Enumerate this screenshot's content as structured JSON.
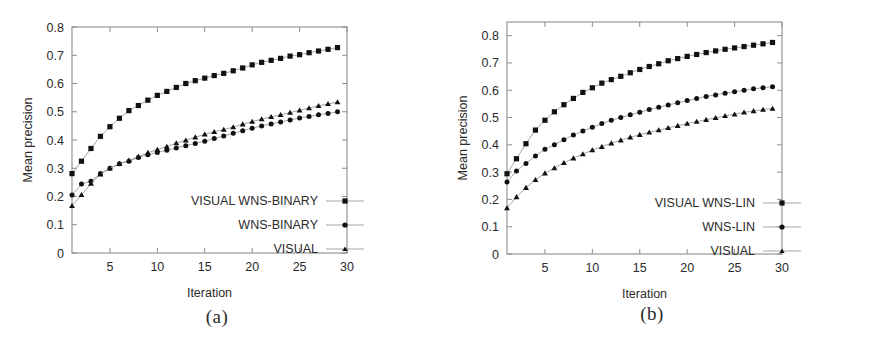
{
  "figure": {
    "panels": [
      {
        "id": "a",
        "subcaption": "(a)",
        "xlabel": "Iteration",
        "ylabel": "Mean precision"
      },
      {
        "id": "b",
        "subcaption": "(b)",
        "xlabel": "Iteration",
        "ylabel": "Mean precision"
      }
    ]
  },
  "chart_data": [
    {
      "panel": "a",
      "type": "line",
      "title": "(a)",
      "xlabel": "Iteration",
      "ylabel": "Mean precision",
      "xlim": [
        1,
        30
      ],
      "ylim": [
        0,
        0.8
      ],
      "xticks": [
        5,
        10,
        15,
        20,
        25,
        30
      ],
      "yticks": [
        "0",
        "0.1",
        "0.2",
        "0.3",
        "0.4",
        "0.5",
        "0.6",
        "0.7",
        "0.8"
      ],
      "ytick_values": [
        0,
        0.1,
        0.2,
        0.3,
        0.4,
        0.5,
        0.6,
        0.7,
        0.8
      ],
      "grid": false,
      "legend_position": "lower right",
      "x": [
        1,
        2,
        3,
        4,
        5,
        6,
        7,
        8,
        9,
        10,
        11,
        12,
        13,
        14,
        15,
        16,
        17,
        18,
        19,
        20,
        21,
        22,
        23,
        24,
        25,
        26,
        27,
        28,
        29
      ],
      "series": [
        {
          "name": "VISUAL WNS-BINARY",
          "marker": "square",
          "color": "#111111",
          "values": [
            0.281,
            0.325,
            0.37,
            0.413,
            0.447,
            0.477,
            0.504,
            0.522,
            0.541,
            0.558,
            0.572,
            0.586,
            0.6,
            0.61,
            0.619,
            0.628,
            0.636,
            0.645,
            0.655,
            0.666,
            0.675,
            0.682,
            0.689,
            0.697,
            0.702,
            0.709,
            0.715,
            0.721,
            0.727
          ]
        },
        {
          "name": "WNS-BINARY",
          "marker": "circle",
          "color": "#111111",
          "values": [
            0.205,
            0.244,
            0.254,
            0.281,
            0.3,
            0.316,
            0.325,
            0.338,
            0.348,
            0.356,
            0.364,
            0.372,
            0.38,
            0.388,
            0.396,
            0.405,
            0.414,
            0.424,
            0.433,
            0.442,
            0.45,
            0.457,
            0.464,
            0.471,
            0.478,
            0.483,
            0.489,
            0.494,
            0.5
          ]
        },
        {
          "name": "VISUAL",
          "marker": "triangle",
          "color": "#111111",
          "values": [
            0.167,
            0.206,
            0.246,
            0.279,
            0.3,
            0.316,
            0.328,
            0.341,
            0.355,
            0.366,
            0.377,
            0.389,
            0.399,
            0.41,
            0.42,
            0.429,
            0.437,
            0.446,
            0.456,
            0.465,
            0.474,
            0.482,
            0.489,
            0.497,
            0.505,
            0.513,
            0.521,
            0.528,
            0.534
          ]
        }
      ]
    },
    {
      "panel": "b",
      "type": "line",
      "title": "(b)",
      "xlabel": "Iteration",
      "ylabel": "Mean precision",
      "xlim": [
        1,
        30
      ],
      "ylim": [
        0,
        0.85
      ],
      "xticks": [
        5,
        10,
        15,
        20,
        25,
        30
      ],
      "yticks": [
        "0",
        "0.1",
        "0.2",
        "0.3",
        "0.4",
        "0.5",
        "0.6",
        "0.7",
        "0.8"
      ],
      "ytick_values": [
        0,
        0.1,
        0.2,
        0.3,
        0.4,
        0.5,
        0.6,
        0.7,
        0.8
      ],
      "grid": false,
      "legend_position": "lower right",
      "x": [
        1,
        2,
        3,
        4,
        5,
        6,
        7,
        8,
        9,
        10,
        11,
        12,
        13,
        14,
        15,
        16,
        17,
        18,
        19,
        20,
        21,
        22,
        23,
        24,
        25,
        26,
        27,
        28,
        29
      ],
      "series": [
        {
          "name": "VISUAL WNS-LIN",
          "marker": "square",
          "color": "#111111",
          "values": [
            0.294,
            0.349,
            0.404,
            0.454,
            0.49,
            0.521,
            0.547,
            0.57,
            0.592,
            0.609,
            0.626,
            0.639,
            0.651,
            0.664,
            0.676,
            0.687,
            0.697,
            0.708,
            0.716,
            0.724,
            0.731,
            0.738,
            0.744,
            0.75,
            0.755,
            0.76,
            0.765,
            0.77,
            0.775
          ]
        },
        {
          "name": "WNS-LIN",
          "marker": "circle",
          "color": "#111111",
          "values": [
            0.264,
            0.304,
            0.332,
            0.359,
            0.384,
            0.4,
            0.419,
            0.436,
            0.451,
            0.464,
            0.478,
            0.49,
            0.5,
            0.51,
            0.519,
            0.529,
            0.538,
            0.546,
            0.554,
            0.562,
            0.57,
            0.577,
            0.583,
            0.589,
            0.594,
            0.6,
            0.605,
            0.609,
            0.613
          ]
        },
        {
          "name": "VISUAL",
          "marker": "triangle",
          "color": "#111111",
          "values": [
            0.168,
            0.209,
            0.243,
            0.272,
            0.296,
            0.315,
            0.334,
            0.351,
            0.366,
            0.381,
            0.393,
            0.406,
            0.417,
            0.428,
            0.437,
            0.446,
            0.454,
            0.462,
            0.47,
            0.478,
            0.485,
            0.492,
            0.499,
            0.506,
            0.512,
            0.519,
            0.524,
            0.529,
            0.533
          ]
        }
      ]
    }
  ]
}
